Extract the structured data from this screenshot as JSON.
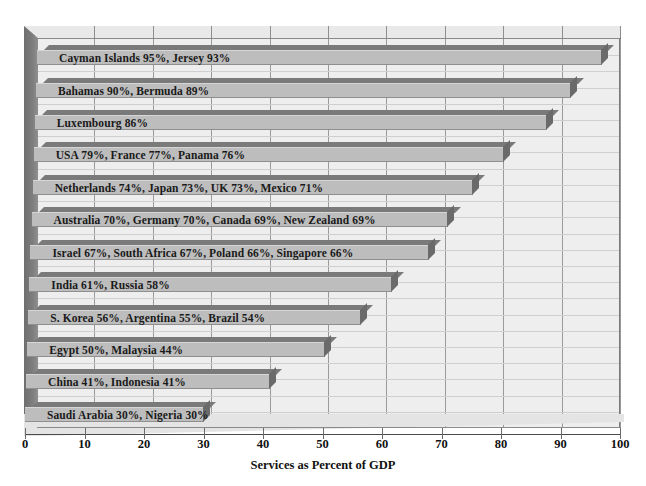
{
  "chart_data": {
    "type": "bar",
    "orientation": "horizontal",
    "title": "",
    "xlabel": "Services as Percent of GDP",
    "ylabel": "",
    "xlim": [
      0,
      100
    ],
    "xticks": [
      "0",
      "10",
      "20",
      "30",
      "40",
      "50",
      "60",
      "70",
      "80",
      "90",
      "100"
    ],
    "grid": true,
    "legend": false,
    "categories": [
      "Cayman Islands 95%, Jersey 93%",
      "Bahamas 90%, Bermuda 89%",
      "Luxembourg 86%",
      "USA 79%, France 77%, Panama 76%",
      "Netherlands 74%, Japan 73%, UK 73%, Mexico 71%",
      "Australia 70%, Germany 70%, Canada 69%, New Zealand 69%",
      "Israel 67%, South Africa 67%, Poland 66%, Singapore 66%",
      "India 61%, Russia 58%",
      "S. Korea 56%, Argentina 55%, Brazil 54%",
      "Egypt 50%, Malaysia 44%",
      "China 41%, Indonesia 41%",
      "Saudi Arabia 30%, Nigeria 30%"
    ],
    "values": [
      95,
      90,
      86,
      79,
      74,
      70,
      67,
      61,
      56,
      50,
      41,
      30
    ],
    "bars": [
      {
        "label": "Cayman Islands 95%, Jersey 93%",
        "value": 95
      },
      {
        "label": "Bahamas 90%, Bermuda 89%",
        "value": 90
      },
      {
        "label": "Luxembourg 86%",
        "value": 86
      },
      {
        "label": "USA 79%, France 77%, Panama 76%",
        "value": 79
      },
      {
        "label": "Netherlands 74%, Japan 73%, UK 73%, Mexico 71%",
        "value": 74
      },
      {
        "label": "Australia 70%, Germany 70%, Canada 69%, New Zealand 69%",
        "value": 70
      },
      {
        "label": "Israel 67%, South Africa 67%, Poland 66%, Singapore 66%",
        "value": 67
      },
      {
        "label": "India 61%, Russia 58%",
        "value": 61
      },
      {
        "label": "S. Korea 56%, Argentina 55%, Brazil 54%",
        "value": 56
      },
      {
        "label": "Egypt 50%, Malaysia 44%",
        "value": 50
      },
      {
        "label": "China 41%, Indonesia 41%",
        "value": 41
      },
      {
        "label": "Saudi Arabia 30%, Nigeria 30%",
        "value": 30
      }
    ],
    "colors": {
      "bar_front": "#bdbdbd",
      "bar_top": "#7a7a7a",
      "bar_side": "#6a6a6a",
      "plot_background": "#eeeeee",
      "grid": "#9a9a9a",
      "text": "#111111"
    }
  }
}
